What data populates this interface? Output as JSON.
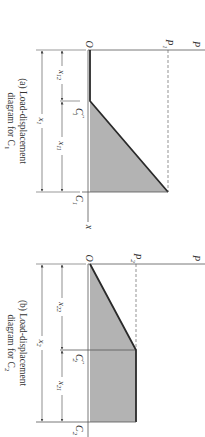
{
  "diagram_a": {
    "caption_line1": "(a) Load-displacement",
    "caption_line2": "diagram for C",
    "caption_sub": "1",
    "axis_p": "P",
    "axis_x": "x",
    "origin": "O",
    "load_label": "P",
    "load_sub": "1",
    "point_mid": "C",
    "point_mid_sub": "1",
    "point_mid_sup": "″",
    "point_end": "C",
    "point_end_sub": "1",
    "dim_a": "x",
    "dim_a_sub": "12",
    "dim_b": "x",
    "dim_b_sub": "11",
    "dim_total": "x",
    "dim_total_sub": "1"
  },
  "diagram_b": {
    "caption_line1": "(b) Load-displacement",
    "caption_line2": "diagram for C",
    "caption_sub": "2",
    "axis_p": "P",
    "origin": "O",
    "load_label": "P",
    "load_sub": "2",
    "point_mid": "C",
    "point_mid_sub": "2",
    "point_mid_sup": "″",
    "point_end": "C",
    "point_end_sub": "2",
    "dim_a": "x",
    "dim_a_sub": "22",
    "dim_b": "x",
    "dim_b_sub": "21",
    "dim_total": "x",
    "dim_total_sub": "2"
  },
  "colors": {
    "fill": "#b3b3b3",
    "line": "#333333",
    "thick": "#2a2a2a"
  }
}
